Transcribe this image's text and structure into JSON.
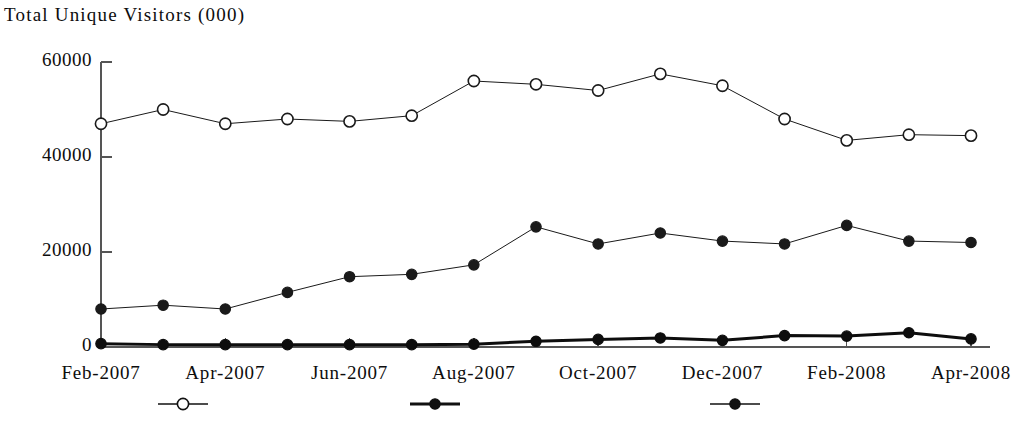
{
  "chart_data": {
    "type": "line",
    "title": "Total Unique Visitors (000)",
    "xlabel": "",
    "ylabel": "",
    "grid": false,
    "ylim": [
      0,
      60000
    ],
    "yticks": [
      0,
      20000,
      40000,
      60000
    ],
    "ytick_labels": [
      "0",
      "20000",
      "40000",
      "60000"
    ],
    "categories": [
      "Feb-2007",
      "Mar-2007",
      "Apr-2007",
      "May-2007",
      "Jun-2007",
      "Jul-2007",
      "Aug-2007",
      "Sep-2007",
      "Oct-2007",
      "Nov-2007",
      "Dec-2007",
      "Jan-2008",
      "Feb-2008",
      "Mar-2008",
      "Apr-2008"
    ],
    "xtick_labels": [
      "Feb-2007",
      "Apr-2007",
      "Jun-2007",
      "Aug-2007",
      "Oct-2007",
      "Dec-2007",
      "Feb-2008",
      "Apr-2008"
    ],
    "xtick_indices": [
      0,
      2,
      4,
      6,
      8,
      10,
      12,
      14
    ],
    "legend_position": "bottom",
    "legend": [
      {
        "marker": "open-circle",
        "line": "thin",
        "label": ""
      },
      {
        "marker": "filled-circle",
        "line": "thick",
        "label": ""
      },
      {
        "marker": "filled-circle",
        "line": "thin",
        "label": ""
      }
    ],
    "series": [
      {
        "name": "series-open-circle",
        "marker": "open-circle",
        "line_width": 1,
        "color": "#1a1a1a",
        "values": [
          47000,
          50000,
          47000,
          48000,
          47500,
          48700,
          56000,
          55300,
          54000,
          57500,
          55000,
          48000,
          43500,
          44700,
          44500
        ]
      },
      {
        "name": "series-filled-circle-thin",
        "marker": "filled-circle",
        "line_width": 1,
        "color": "#1a1a1a",
        "values": [
          8000,
          8800,
          8000,
          11500,
          14800,
          15300,
          17300,
          25300,
          21700,
          24000,
          22300,
          21700,
          25600,
          22300,
          22000
        ]
      },
      {
        "name": "series-filled-circle-thick",
        "marker": "filled-circle",
        "line_width": 3,
        "color": "#0d0d0d",
        "values": [
          700,
          500,
          500,
          500,
          500,
          500,
          600,
          1200,
          1600,
          1900,
          1400,
          2400,
          2300,
          3000,
          1700
        ]
      }
    ]
  },
  "axes": {
    "y_axis_color": "#555555",
    "x_axis_color": "#555555"
  }
}
